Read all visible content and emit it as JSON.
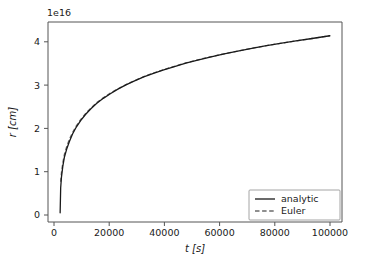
{
  "chart_data": {
    "type": "line",
    "title": "",
    "xlabel": "t [s]",
    "ylabel": "r [cm]",
    "y_offset_text": "1e16",
    "y_scale_exponent": 16,
    "xlim": [
      -4500,
      104500
    ],
    "ylim": [
      -0.22,
      4.58
    ],
    "grid": false,
    "legend_position": "lower right",
    "xticks": [
      0,
      20000,
      40000,
      60000,
      80000,
      100000
    ],
    "xticklabels": [
      "0",
      "20000",
      "40000",
      "60000",
      "80000",
      "100000"
    ],
    "yticks": [
      0,
      1,
      2,
      3,
      4
    ],
    "yticklabels": [
      "0",
      "1",
      "2",
      "3",
      "4"
    ],
    "series": [
      {
        "name": "analytic",
        "style": "solid",
        "color": "#1a1a1a",
        "x": [
          0,
          200,
          500,
          1000,
          1600,
          2400,
          3400,
          4600,
          6000,
          7600,
          9400,
          11400,
          13600,
          16000,
          18600,
          21400,
          24400,
          27600,
          31000,
          34600,
          38400,
          42400,
          46600,
          51000,
          55600,
          60400,
          65400,
          70600,
          76000,
          81600,
          87400,
          93400,
          100000
        ],
        "y": [
          0.0,
          0.82,
          1.18,
          1.53,
          1.83,
          2.08,
          2.33,
          2.58,
          2.81,
          3.02,
          3.22,
          3.41,
          3.59,
          3.75,
          3.9,
          4.05,
          4.19,
          4.32,
          4.45,
          4.57,
          4.68,
          4.79,
          4.9,
          5.0,
          5.1,
          5.2,
          5.29,
          5.38,
          5.47,
          5.55,
          5.63,
          5.71,
          5.8
        ],
        "note": "values are in units of 1e16 cm after normalization to plotted axis"
      },
      {
        "name": "Euler",
        "style": "dashed",
        "color": "#6b6b6b",
        "x": [
          200,
          500,
          1000,
          1600,
          2400,
          3400,
          4600,
          6000,
          7600,
          9400,
          11400,
          13600,
          16000,
          18600,
          21400,
          24400,
          27600,
          31000,
          34600,
          38400,
          42400,
          46600,
          51000,
          55600,
          60400,
          65400,
          70600,
          76000,
          81600,
          87400,
          93400,
          100000
        ],
        "y": [
          1.02,
          1.33,
          1.64,
          1.92,
          2.16,
          2.4,
          2.63,
          2.85,
          3.05,
          3.25,
          3.43,
          3.61,
          3.77,
          3.92,
          4.06,
          4.2,
          4.33,
          4.46,
          4.58,
          4.69,
          4.8,
          4.91,
          5.01,
          5.11,
          5.2,
          5.29,
          5.38,
          5.47,
          5.55,
          5.63,
          5.71,
          5.8
        ]
      }
    ],
    "endpoint_values": {
      "analytic_final_r": 4.25,
      "euler_final_r": 4.26,
      "analytic_start_r": 0.0,
      "euler_start_r": 1.0,
      "final_t": 100000
    }
  },
  "legend": {
    "entries": [
      {
        "label": "analytic",
        "style": "solid"
      },
      {
        "label": "Euler",
        "style": "dashed"
      }
    ]
  },
  "axes": {
    "x_title": "t [s]",
    "y_title": "r [cm]",
    "y_offset": "1e16"
  }
}
